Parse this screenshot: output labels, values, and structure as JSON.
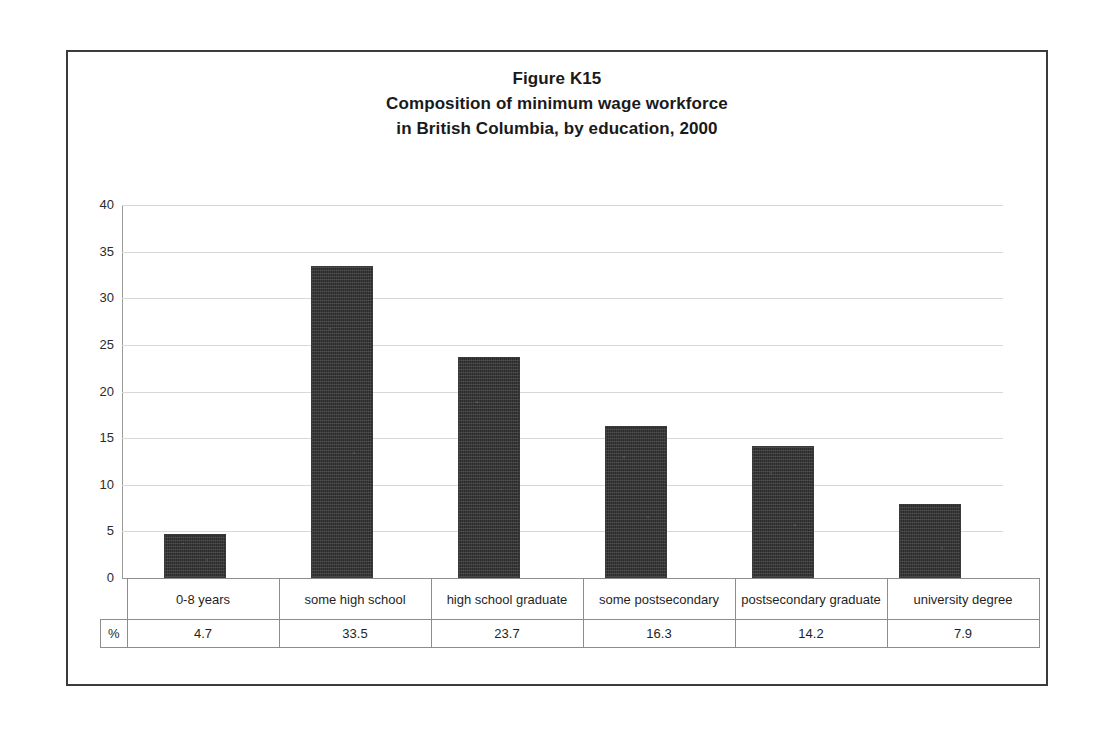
{
  "figure": {
    "title_lines": [
      "Figure K15",
      "Composition of minimum wage workforce",
      "in British Columbia, by education, 2000"
    ],
    "unit_label": "%"
  },
  "chart_data": {
    "type": "bar",
    "xlabel": "",
    "ylabel": "",
    "ylim": [
      0,
      40
    ],
    "yticks": [
      40,
      35,
      30,
      25,
      20,
      15,
      10,
      5,
      0
    ],
    "ytick_labels": [
      "40",
      "35",
      "30",
      "25",
      "20",
      "15",
      "10",
      "5",
      "0"
    ],
    "grid": true,
    "legend": "none",
    "bar_color": "#2b2b2b",
    "gridline_color": "#d8d8d8",
    "categories": [
      "0-8 years",
      "some high school",
      "high school graduate",
      "some postsecondary",
      "postsecondary graduate",
      "university degree"
    ],
    "values": [
      4.7,
      33.5,
      23.7,
      16.3,
      14.2,
      7.9
    ],
    "value_labels": [
      "4.7",
      "33.5",
      "23.7",
      "16.3",
      "14.2",
      "7.9"
    ]
  }
}
